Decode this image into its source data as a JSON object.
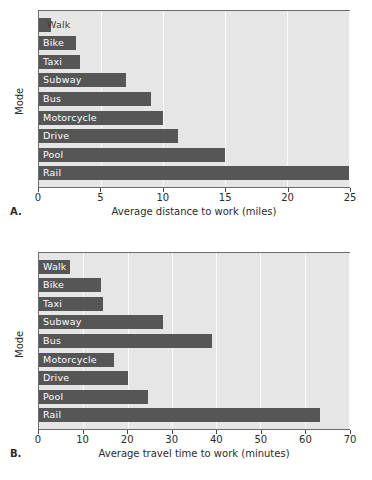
{
  "figure": {
    "background": "#ffffff",
    "bar_color": "#565656",
    "plot_background": "#e6e6e6",
    "gridline_color": "#fafafa",
    "frame_color": "#6b6b6b"
  },
  "panels": [
    {
      "letter": "A.",
      "ylabel": "Mode",
      "xlabel": "Average distance to work (miles)",
      "xticks": [
        0,
        5,
        10,
        15,
        20,
        25
      ],
      "xlim": [
        0,
        25
      ]
    },
    {
      "letter": "B.",
      "ylabel": "Mode",
      "xlabel": "Average travel time to work (minutes)",
      "xticks": [
        0,
        10,
        20,
        30,
        40,
        50,
        60,
        70
      ],
      "xlim": [
        0,
        70
      ]
    }
  ],
  "chart_data": [
    {
      "type": "bar",
      "orientation": "horizontal",
      "panel": "A",
      "title": "",
      "xlabel": "Average distance to work (miles)",
      "ylabel": "Mode",
      "xlim": [
        0,
        25
      ],
      "xticks": [
        0,
        5,
        10,
        15,
        20,
        25
      ],
      "grid": true,
      "legend": "none",
      "categories": [
        "Walk",
        "Bike",
        "Taxi",
        "Subway",
        "Bus",
        "Motorcycle",
        "Drive",
        "Pool",
        "Rail"
      ],
      "values": [
        1.0,
        3.0,
        3.3,
        7.0,
        9.0,
        10.0,
        11.2,
        15.0,
        25.0
      ]
    },
    {
      "type": "bar",
      "orientation": "horizontal",
      "panel": "B",
      "title": "",
      "xlabel": "Average travel time to work (minutes)",
      "ylabel": "Mode",
      "xlim": [
        0,
        70
      ],
      "xticks": [
        0,
        10,
        20,
        30,
        40,
        50,
        60,
        70
      ],
      "grid": true,
      "legend": "none",
      "categories": [
        "Walk",
        "Bike",
        "Taxi",
        "Taxi",
        "Bus",
        "Motorcycle",
        "Drive",
        "Pool",
        "Rail"
      ],
      "values": [
        7.0,
        14.0,
        14.5,
        28.0,
        39.0,
        17.0,
        20.0,
        24.5,
        63.5
      ]
    }
  ]
}
